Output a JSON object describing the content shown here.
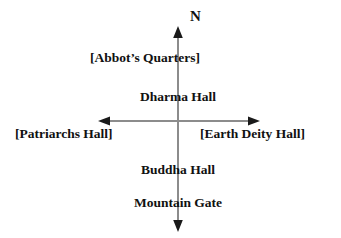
{
  "diagram": {
    "compass": {
      "north_label": "N",
      "icon": "north-arrow-icon"
    },
    "axis": {
      "line_color": "#8c8c8c",
      "arrow_color": "#1a1a1a",
      "vertical_x": 178,
      "vertical_top_y": 28,
      "vertical_bottom_y": 230,
      "horizontal_y": 121,
      "horizontal_left_x": 100,
      "horizontal_right_x": 258
    },
    "text_color": "#111111",
    "background_color": "#ffffff",
    "labels": [
      {
        "text": "[Abbot’s Quarters]",
        "position": "north-upper",
        "x": 145,
        "y": 51
      },
      {
        "text": "Dharma Hall",
        "position": "north-lower",
        "x": 178,
        "y": 90
      },
      {
        "text": "[Patriarchs Hall]",
        "position": "west",
        "x": 15,
        "y": 127
      },
      {
        "text": "[Earth Deity Hall]",
        "position": "east",
        "x": 200,
        "y": 127
      },
      {
        "text": "Buddha Hall",
        "position": "south-upper",
        "x": 178,
        "y": 163
      },
      {
        "text": "Mountain Gate",
        "position": "south-lower",
        "x": 178,
        "y": 196
      }
    ]
  }
}
